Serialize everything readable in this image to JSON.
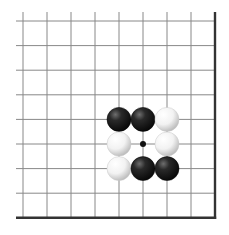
{
  "diagram": {
    "type": "go-board-corner",
    "grid": {
      "columns": 9,
      "rows": 9,
      "x_start": 23,
      "x_step": 24,
      "y_start": 21,
      "y_step": 24.6,
      "line_color": "#888888",
      "edge_color": "#333333",
      "edges": [
        "right",
        "bottom"
      ]
    },
    "star_points": [
      {
        "col": 5,
        "row": 5
      }
    ],
    "stones": [
      {
        "col": 4,
        "row": 4,
        "color": "black"
      },
      {
        "col": 5,
        "row": 4,
        "color": "black"
      },
      {
        "col": 6,
        "row": 4,
        "color": "white"
      },
      {
        "col": 4,
        "row": 5,
        "color": "white"
      },
      {
        "col": 6,
        "row": 5,
        "color": "white"
      },
      {
        "col": 4,
        "row": 6,
        "color": "white"
      },
      {
        "col": 5,
        "row": 6,
        "color": "black"
      },
      {
        "col": 6,
        "row": 6,
        "color": "black"
      }
    ],
    "stone_radius": 12,
    "colors": {
      "black_stone": "#1a1a1a",
      "white_stone": "#f4f4f4",
      "background": "#ffffff"
    }
  }
}
